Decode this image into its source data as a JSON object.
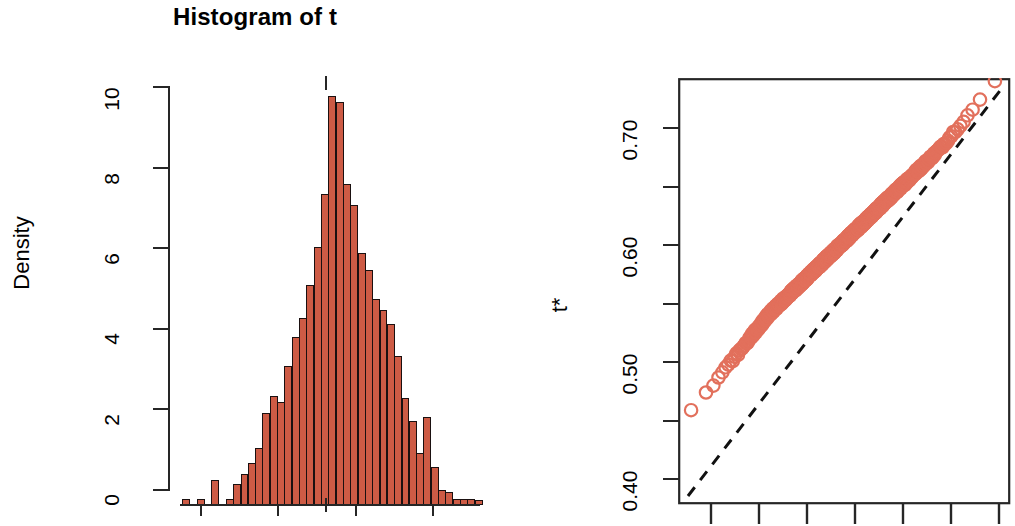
{
  "figure": {
    "title": "Histogram of t",
    "background": "#ffffff",
    "bar_fill": "#CD5B45",
    "bar_border": "#1a1010",
    "point_color": "#E2705C",
    "line_color": "#111111",
    "axis_color": "#262626"
  },
  "histogram_panel": {
    "ylabel": "Density",
    "y_ticks": [
      "0",
      "2",
      "4",
      "6",
      "8",
      "10"
    ],
    "x_ticks": [
      "",
      "",
      "",
      ""
    ],
    "rug_label": "t0"
  },
  "qq_panel": {
    "ylabel": "t*",
    "y_ticks": [
      "0.40",
      "0.50",
      "0.60",
      "0.70"
    ],
    "y_minor_ticks": [
      "0.45",
      "0.55",
      "0.65"
    ],
    "xlabel": ""
  },
  "chart_data": [
    {
      "type": "bar",
      "title": "Histogram of t",
      "xlabel": "t",
      "ylabel": "Density",
      "ylim": [
        0,
        10
      ],
      "y_ticks": [
        0,
        2,
        4,
        6,
        8,
        10
      ],
      "grid": false,
      "note": "Bootstrap replicate density histogram; bin centers in units of t, density on y. Vertical rug tick marks observed statistic t0.",
      "bin_centers": [
        0.405,
        0.415,
        0.425,
        0.435,
        0.445,
        0.455,
        0.465,
        0.475,
        0.485,
        0.495,
        0.505,
        0.515,
        0.525,
        0.535,
        0.545,
        0.555,
        0.565,
        0.575,
        0.585,
        0.595,
        0.605,
        0.615,
        0.625,
        0.635,
        0.645,
        0.655,
        0.665,
        0.675,
        0.685,
        0.695,
        0.705,
        0.715,
        0.725,
        0.735,
        0.745,
        0.755
      ],
      "values": [
        0.15,
        0.0,
        0.15,
        0.0,
        0.6,
        0.0,
        0.15,
        0.5,
        0.75,
        1.0,
        1.35,
        2.2,
        2.6,
        2.45,
        3.3,
        4.0,
        4.45,
        5.25,
        6.15,
        7.4,
        9.75,
        9.6,
        7.65,
        7.15,
        6.0,
        5.6,
        4.9,
        4.65,
        4.3,
        3.55,
        2.55,
        2.0,
        1.25,
        2.1,
        0.9,
        0.35
      ],
      "tail_values": [
        0.3,
        0.15,
        0.15,
        0.15,
        0.12
      ],
      "t0": 0.613
    },
    {
      "type": "scatter",
      "title": "",
      "xlabel": "Quantiles of Standard Normal",
      "ylabel": "t*",
      "ylim": [
        0.385,
        0.755
      ],
      "y_ticks": [
        0.4,
        0.45,
        0.5,
        0.55,
        0.6,
        0.65,
        0.7
      ],
      "y_tick_labels": [
        "0.40",
        "",
        "0.50",
        "",
        "0.60",
        "",
        "0.70"
      ],
      "xlim": [
        -3.4,
        3.4
      ],
      "grid": false,
      "note": "Normal Q-Q plot of bootstrap replicates t* with dashed reference line; dense near-linear band with slight low-tail departure.",
      "reference_line": {
        "style": "dashed",
        "color": "#111111"
      },
      "n_points": 999
    }
  ]
}
